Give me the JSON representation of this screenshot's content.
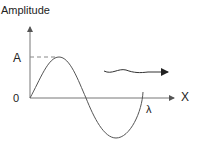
{
  "diagram": {
    "y_axis_label": "Amplitude",
    "x_axis_label": "X",
    "amplitude_label": "A",
    "origin_label": "0",
    "wavelength_label": "λ",
    "colors": {
      "curve": "#555555",
      "axis": "#666666",
      "arrow": "#222222"
    }
  }
}
